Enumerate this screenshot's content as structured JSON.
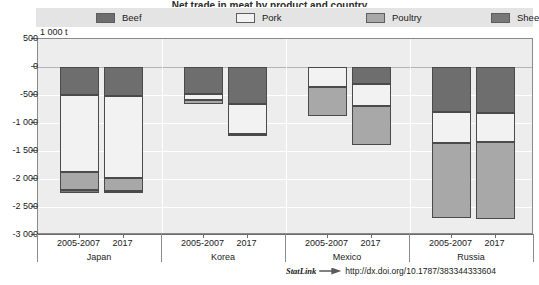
{
  "title": "Net trade in meat by product and country",
  "legend": {
    "position": "top",
    "items": [
      {
        "label": "Beef",
        "color": "#6e6e6e",
        "key": "beef"
      },
      {
        "label": "Pork",
        "color": "#f2f2f2",
        "key": "pork"
      },
      {
        "label": "Poultry",
        "color": "#a8a8a8",
        "key": "poultry"
      },
      {
        "label": "Sheep",
        "color": "#787878",
        "key": "sheep"
      }
    ]
  },
  "axis_unit": "1 000 t",
  "statlink": {
    "word": "StatLink",
    "url": "http://dx.doi.org/10.1787/383344333604"
  },
  "chart_data": {
    "type": "bar",
    "title": "Net trade in meat by product and country",
    "subtype": "stacked-negative",
    "xlabel": "",
    "ylabel": "1 000 t",
    "ylim": [
      -3000,
      500
    ],
    "yticks": [
      500,
      0,
      -500,
      -1000,
      -1500,
      -2000,
      -2500,
      -3000
    ],
    "ytick_labels": [
      "500",
      "0",
      "-500",
      "-1 000",
      "-1 500",
      "-2 000",
      "-2 500",
      "-3 000"
    ],
    "grid": true,
    "legend_position": "top",
    "groups": [
      "Japan",
      "Korea",
      "Mexico",
      "Russia"
    ],
    "periods": [
      "2005-2007",
      "2017"
    ],
    "series": [
      {
        "name": "Beef",
        "color": "#6e6e6e",
        "values": [
          -500,
          -520,
          -480,
          -660,
          0,
          -300,
          -800,
          -830
        ]
      },
      {
        "name": "Pork",
        "color": "#f2f2f2",
        "values": [
          -1370,
          -1460,
          -110,
          -540,
          -360,
          -400,
          -550,
          -510
        ]
      },
      {
        "name": "Poultry",
        "color": "#a8a8a8",
        "values": [
          -330,
          -230,
          -70,
          -10,
          -520,
          -700,
          -1350,
          -1380
        ]
      },
      {
        "name": "Sheep",
        "color": "#787878",
        "values": [
          -50,
          -40,
          0,
          0,
          0,
          0,
          0,
          0
        ]
      }
    ],
    "bars": [
      {
        "group": "Japan",
        "period": "2005-2007",
        "total": -2250,
        "stack": [
          {
            "s": "Beef",
            "from": 0,
            "to": -500
          },
          {
            "s": "Pork",
            "from": -500,
            "to": -1870
          },
          {
            "s": "Poultry",
            "from": -1870,
            "to": -2200
          },
          {
            "s": "Sheep",
            "from": -2200,
            "to": -2250
          }
        ]
      },
      {
        "group": "Japan",
        "period": "2017",
        "total": -2250,
        "stack": [
          {
            "s": "Beef",
            "from": 0,
            "to": -520
          },
          {
            "s": "Pork",
            "from": -520,
            "to": -1980
          },
          {
            "s": "Poultry",
            "from": -1980,
            "to": -2210
          },
          {
            "s": "Sheep",
            "from": -2210,
            "to": -2250
          }
        ]
      },
      {
        "group": "Korea",
        "period": "2005-2007",
        "total": -660,
        "stack": [
          {
            "s": "Beef",
            "from": 0,
            "to": -480
          },
          {
            "s": "Pork",
            "from": -480,
            "to": -590
          },
          {
            "s": "Poultry",
            "from": -590,
            "to": -660
          }
        ]
      },
      {
        "group": "Korea",
        "period": "2017",
        "total": -1210,
        "stack": [
          {
            "s": "Beef",
            "from": 0,
            "to": -660
          },
          {
            "s": "Pork",
            "from": -660,
            "to": -1200
          },
          {
            "s": "Poultry",
            "from": -1200,
            "to": -1210
          }
        ]
      },
      {
        "group": "Mexico",
        "period": "2005-2007",
        "total": -880,
        "stack": [
          {
            "s": "Pork",
            "from": 0,
            "to": -360
          },
          {
            "s": "Poultry",
            "from": -360,
            "to": -880
          }
        ]
      },
      {
        "group": "Mexico",
        "period": "2017",
        "total": -1400,
        "stack": [
          {
            "s": "Beef",
            "from": 0,
            "to": -300
          },
          {
            "s": "Pork",
            "from": -300,
            "to": -700
          },
          {
            "s": "Poultry",
            "from": -700,
            "to": -1400
          }
        ]
      },
      {
        "group": "Russia",
        "period": "2005-2007",
        "total": -2700,
        "stack": [
          {
            "s": "Beef",
            "from": 0,
            "to": -800
          },
          {
            "s": "Pork",
            "from": -800,
            "to": -1350
          },
          {
            "s": "Poultry",
            "from": -1350,
            "to": -2700
          }
        ]
      },
      {
        "group": "Russia",
        "period": "2017",
        "total": -2720,
        "stack": [
          {
            "s": "Beef",
            "from": 0,
            "to": -830
          },
          {
            "s": "Pork",
            "from": -830,
            "to": -1340
          },
          {
            "s": "Poultry",
            "from": -1340,
            "to": -2720
          }
        ]
      }
    ]
  }
}
